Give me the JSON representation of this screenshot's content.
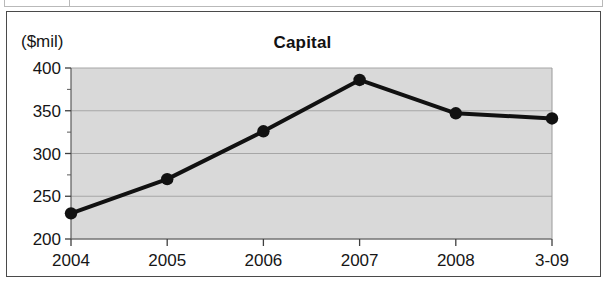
{
  "figure": {
    "unit_label": "($mil)",
    "title": "Capital"
  },
  "chart_data": {
    "type": "line",
    "title": "Capital",
    "xlabel": "",
    "ylabel": "($mil)",
    "unit_note": "($mil)",
    "categories": [
      "2004",
      "2005",
      "2006",
      "2007",
      "2008",
      "3-09"
    ],
    "values": [
      230,
      270,
      326,
      386,
      347,
      341
    ],
    "series": [
      {
        "name": "Capital",
        "values": [
          230,
          270,
          326,
          386,
          347,
          341
        ]
      }
    ],
    "ylim": [
      200,
      400
    ],
    "yticks": [
      200,
      250,
      300,
      350,
      400
    ],
    "ytick_labels": [
      "200",
      "250",
      "300",
      "350",
      "400"
    ],
    "y_minor_tick_step": 25,
    "grid": true,
    "grid_axis": "y",
    "legend": false,
    "legend_position": "none",
    "marker": "circle",
    "marker_color": "#111111",
    "line_color": "#111111",
    "line_width": 4,
    "plot_background": "#d9d9d9",
    "figure_background": "#ffffff"
  },
  "axis": {
    "y_labels": [
      "400",
      "350",
      "300",
      "250",
      "200"
    ],
    "x_labels": [
      "2004",
      "2005",
      "2006",
      "2007",
      "2008",
      "3-09"
    ]
  }
}
